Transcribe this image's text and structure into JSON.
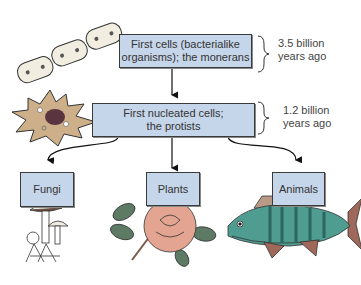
{
  "diagram": {
    "type": "evolutionary-flowchart",
    "nodes": [
      {
        "id": "monerans",
        "line1": "First cells (bacterialike",
        "line2": "organisms); the monerans",
        "time_line1": "3.5 billion",
        "time_line2": "years ago"
      },
      {
        "id": "protists",
        "line1": "First nucleated cells;",
        "line2": "the protists",
        "time_line1": "1.2 billion",
        "time_line2": "years ago"
      },
      {
        "id": "fungi",
        "label": "Fungi"
      },
      {
        "id": "plants",
        "label": "Plants"
      },
      {
        "id": "animals",
        "label": "Animals"
      }
    ],
    "edges": [
      {
        "from": "monerans",
        "to": "protists"
      },
      {
        "from": "protists",
        "to": "fungi"
      },
      {
        "from": "protists",
        "to": "plants"
      },
      {
        "from": "protists",
        "to": "animals"
      }
    ],
    "illustrations": [
      "bacteria-chain",
      "amoeba",
      "mushrooms",
      "rose",
      "perch-fish"
    ],
    "colors": {
      "box_fill": "#c6d6ea",
      "box_border": "#3a3a3a",
      "arrow": "#111111"
    }
  }
}
